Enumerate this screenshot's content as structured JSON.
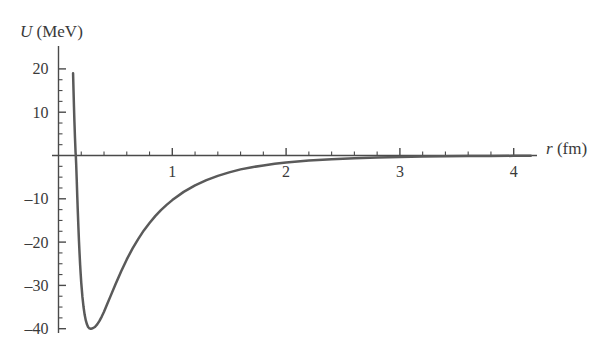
{
  "chart_data": {
    "type": "line",
    "title": "",
    "subtitle": "",
    "xlabel": "r (fm)",
    "xlabel_symbol": "r",
    "xlabel_unit": "(fm)",
    "ylabel": "U (MeV)",
    "ylabel_symbol": "U",
    "ylabel_unit": "(MeV)",
    "xlim": [
      0,
      4.25
    ],
    "ylim": [
      -42,
      21
    ],
    "grid": false,
    "legend": null,
    "x_ticks_major": [
      1,
      2,
      3,
      4
    ],
    "x_tick_labels": [
      "1",
      "2",
      "3",
      "4"
    ],
    "x_minor_tick_step": 0.2,
    "y_ticks_major": [
      20,
      10,
      -10,
      -20,
      -30,
      -40
    ],
    "y_tick_labels": [
      "20",
      "10",
      "–10",
      "–20",
      "–30",
      "–40"
    ],
    "y_minor_tick_step": 2.5,
    "curve_color": "#5a5a5a",
    "axis_color": "#4a4a4a",
    "text_color": "#3a3a3a",
    "annotations": [],
    "well_depth": -40,
    "well_position": 0.32,
    "zero_crossing": 0.152,
    "peak_value": 19,
    "series": [
      {
        "name": "U(r)",
        "x": [
          0.128,
          0.132,
          0.136,
          0.14,
          0.145,
          0.15,
          0.152,
          0.155,
          0.16,
          0.165,
          0.17,
          0.175,
          0.18,
          0.185,
          0.19,
          0.195,
          0.2,
          0.21,
          0.22,
          0.23,
          0.24,
          0.25,
          0.26,
          0.27,
          0.28,
          0.29,
          0.3,
          0.32,
          0.34,
          0.36,
          0.38,
          0.4,
          0.43,
          0.46,
          0.5,
          0.55,
          0.6,
          0.65,
          0.7,
          0.75,
          0.8,
          0.85,
          0.9,
          0.95,
          1.0,
          1.1,
          1.2,
          1.3,
          1.4,
          1.5,
          1.6,
          1.7,
          1.8,
          1.9,
          2.0,
          2.2,
          2.4,
          2.6,
          2.8,
          3.0,
          3.2,
          3.4,
          3.6,
          3.8,
          4.0,
          4.15
        ],
        "y": [
          19.0,
          15.0,
          11.2,
          7.8,
          4.0,
          0.7,
          0.0,
          -1.8,
          -5.5,
          -9.5,
          -13.2,
          -16.6,
          -19.8,
          -22.6,
          -25.2,
          -27.4,
          -29.4,
          -32.6,
          -35.0,
          -36.8,
          -38.1,
          -39.0,
          -39.6,
          -39.9,
          -40.0,
          -40.0,
          -39.9,
          -39.6,
          -39.0,
          -38.2,
          -37.2,
          -36.1,
          -34.2,
          -32.3,
          -29.8,
          -26.8,
          -24.0,
          -21.5,
          -19.3,
          -17.3,
          -15.6,
          -14.0,
          -12.6,
          -11.4,
          -10.3,
          -8.4,
          -6.9,
          -5.7,
          -4.7,
          -3.9,
          -3.2,
          -2.7,
          -2.3,
          -1.9,
          -1.6,
          -1.15,
          -0.85,
          -0.62,
          -0.45,
          -0.34,
          -0.25,
          -0.19,
          -0.14,
          -0.11,
          -0.08,
          -0.06
        ]
      }
    ]
  },
  "axes": {
    "x_axis_name": "x-axis",
    "y_axis_name": "y-axis"
  }
}
